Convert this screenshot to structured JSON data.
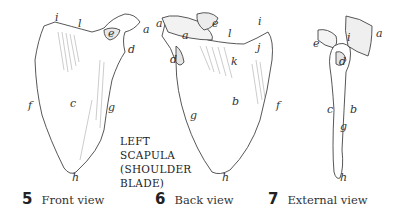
{
  "title": {
    "lines": [
      "LEFT",
      "SCAPULA",
      "(SHOULDER",
      "BLADE)"
    ]
  },
  "views": [
    {
      "number": "5",
      "caption": "Front view",
      "labels": {
        "i": "i",
        "l": "l",
        "e": "e",
        "a": "a",
        "d": "d",
        "f": "f",
        "c": "c",
        "g": "g",
        "h": "h"
      }
    },
    {
      "number": "6",
      "caption": "Back view",
      "labels": {
        "a1": "a",
        "e": "e",
        "i": "i",
        "a2": "a",
        "l": "l",
        "j": "j",
        "d": "d",
        "k": "k",
        "b": "b",
        "g": "g",
        "f": "f",
        "h": "h"
      }
    },
    {
      "number": "7",
      "caption": "External view",
      "labels": {
        "e": "e",
        "i": "i",
        "a": "a",
        "d": "d",
        "c": "c",
        "b": "b",
        "g": "g",
        "h": "h"
      }
    }
  ],
  "colors": {
    "ink": "#333333",
    "bone_fill": "#ffffff",
    "shade": "#9a9a9a",
    "background": "#ffffff"
  }
}
